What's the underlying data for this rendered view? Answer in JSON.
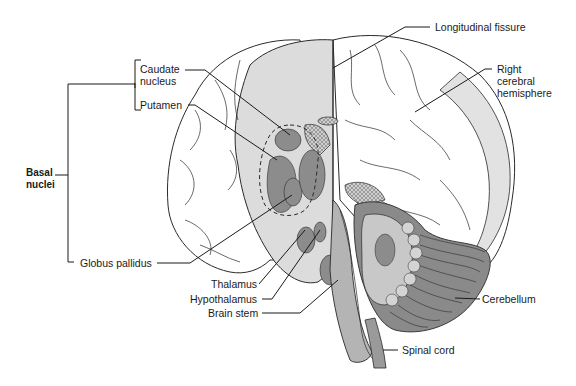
{
  "diagram": {
    "colors": {
      "outline": "#2a2a2a",
      "cortex_white": "#ffffff",
      "cut_surface": "#dcdcdc",
      "nuclei": "#8c8c8c",
      "brainstem": "#b4b4b4",
      "cerebellum_dark": "#8a8a8a",
      "cerebellum_light": "#c8c8c8",
      "hatched": "#c0c0c0"
    },
    "labels": {
      "longitudinal_fissure": "Longitudinal fissure",
      "right_hemisphere_1": "Right",
      "right_hemisphere_2": "cerebral",
      "right_hemisphere_3": "hemisphere",
      "caudate_1": "Caudate",
      "caudate_2": "nucleus",
      "putamen": "Putamen",
      "basal_1": "Basal",
      "basal_2": "nuclei",
      "globus_pallidus": "Globus pallidus",
      "thalamus": "Thalamus",
      "hypothalamus": "Hypothalamus",
      "brain_stem": "Brain stem",
      "cerebellum": "Cerebellum",
      "spinal_cord": "Spinal cord"
    }
  }
}
